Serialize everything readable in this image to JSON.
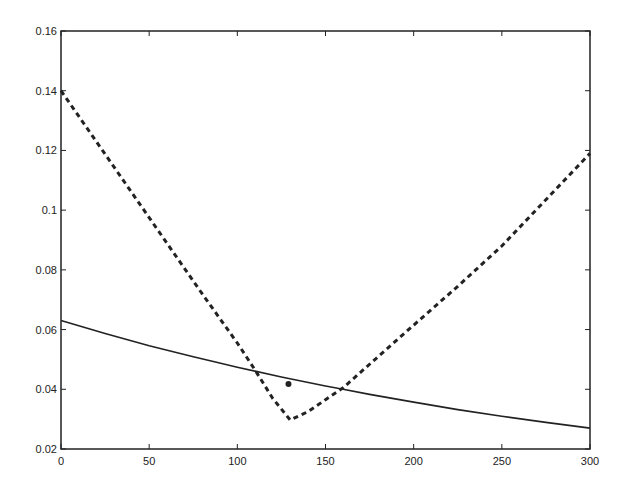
{
  "chart_data": {
    "type": "line",
    "title": "",
    "xlabel": "",
    "ylabel": "",
    "xlim": [
      0,
      300
    ],
    "ylim": [
      0.02,
      0.16
    ],
    "grid": false,
    "legend": "none",
    "x_ticks": [
      "0",
      "50",
      "100",
      "150",
      "200",
      "250",
      "300"
    ],
    "y_ticks": [
      "0.02",
      "0.04",
      "0.06",
      "0.08",
      "0.1",
      "0.12",
      "0.14",
      "0.16"
    ],
    "series": [
      {
        "name": "solid",
        "style": "solid",
        "x": [
          0,
          25,
          50,
          75,
          87,
          100,
          125,
          150,
          160,
          175,
          200,
          225,
          250,
          275,
          300
        ],
        "values": [
          0.063,
          0.0587,
          0.0546,
          0.0509,
          0.0492,
          0.0474,
          0.0441,
          0.0411,
          0.04,
          0.0383,
          0.0357,
          0.0332,
          0.031,
          0.0289,
          0.027
        ]
      },
      {
        "name": "dashed",
        "style": "dashed",
        "x": [
          0,
          20,
          40,
          60,
          80,
          100,
          110,
          120,
          130,
          140,
          150,
          160,
          180,
          200,
          225,
          250,
          275,
          300
        ],
        "values": [
          0.14,
          0.123,
          0.106,
          0.089,
          0.072,
          0.0555,
          0.0465,
          0.037,
          0.0297,
          0.0325,
          0.0365,
          0.0405,
          0.051,
          0.0615,
          0.0745,
          0.088,
          0.1035,
          0.119
        ]
      }
    ],
    "points": [
      {
        "name": "marker",
        "x": 129,
        "y": 0.0418
      }
    ]
  }
}
